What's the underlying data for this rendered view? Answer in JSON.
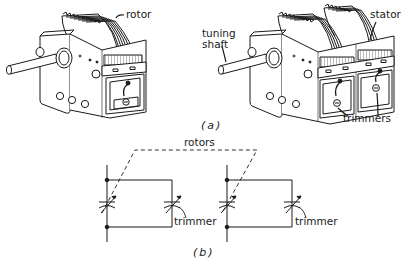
{
  "figure": {
    "part_a": {
      "caption": "(a)",
      "single_gang": {
        "labels": {
          "rotor": "rotor"
        }
      },
      "dual_gang": {
        "labels": {
          "tuning_shaft": "tuning\nshaft",
          "stator": "stator",
          "trimmers": "trimmers"
        }
      }
    },
    "part_b": {
      "caption": "(b)",
      "labels": {
        "rotors": "rotors",
        "trimmer_left": "trimmer",
        "trimmer_right": "trimmer"
      }
    }
  },
  "colors": {
    "ink": "#1a1a1a",
    "background": "#ffffff",
    "shade": "#d9d9d9"
  }
}
